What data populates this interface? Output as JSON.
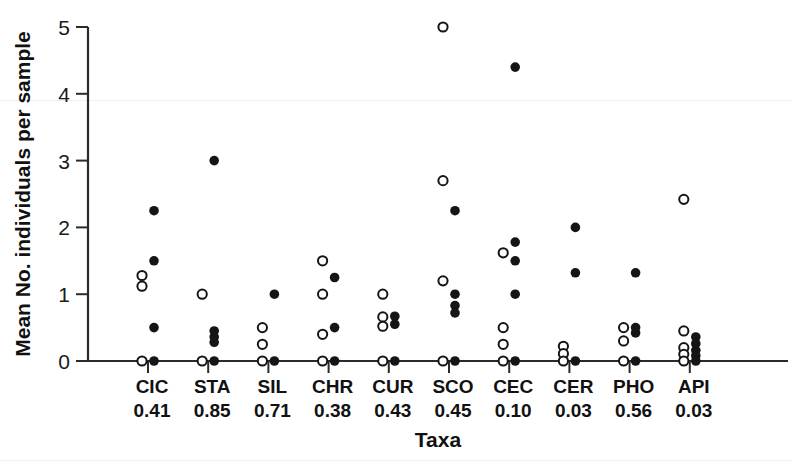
{
  "figure": {
    "y_axis_title": "Mean No. individuals per sample",
    "x_axis_title": "Taxa"
  },
  "chart_data": {
    "type": "scatter",
    "title": "",
    "xlabel": "Taxa",
    "ylabel": "Mean No. individuals per sample",
    "ylim": [
      0,
      5
    ],
    "yticks": [
      0,
      1,
      2,
      3,
      4,
      5
    ],
    "ytick_labels": [
      "0",
      "1",
      "2",
      "3",
      "4",
      "5"
    ],
    "grid": false,
    "legend": "none",
    "categories": [
      "CIC",
      "STA",
      "SIL",
      "CHR",
      "CUR",
      "SCO",
      "CEC",
      "CER",
      "PHO",
      "API"
    ],
    "category_values": [
      "0.41",
      "0.85",
      "0.71",
      "0.38",
      "0.43",
      "0.45",
      "0.10",
      "0.03",
      "0.56",
      "0.03"
    ],
    "series": [
      {
        "name": "open",
        "marker": "open-circle",
        "points": [
          {
            "category": "CIC",
            "values": [
              1.28,
              1.12,
              0.0
            ]
          },
          {
            "category": "STA",
            "values": [
              1.0,
              0.0
            ]
          },
          {
            "category": "SIL",
            "values": [
              0.5,
              0.25,
              0.0
            ]
          },
          {
            "category": "CHR",
            "values": [
              1.5,
              1.0,
              0.4,
              0.0
            ]
          },
          {
            "category": "CUR",
            "values": [
              1.0,
              0.66,
              0.52,
              0.0
            ]
          },
          {
            "category": "SCO",
            "values": [
              5.0,
              2.7,
              1.2,
              0.0
            ]
          },
          {
            "category": "CEC",
            "values": [
              1.62,
              0.5,
              0.25,
              0.0
            ]
          },
          {
            "category": "CER",
            "values": [
              0.22,
              0.11,
              0.0
            ]
          },
          {
            "category": "PHO",
            "values": [
              0.5,
              0.3,
              0.0
            ]
          },
          {
            "category": "API",
            "values": [
              2.42,
              0.45,
              0.2,
              0.1,
              0.0
            ]
          }
        ]
      },
      {
        "name": "filled",
        "marker": "filled-circle",
        "points": [
          {
            "category": "CIC",
            "values": [
              2.25,
              1.5,
              0.5,
              0.0
            ]
          },
          {
            "category": "STA",
            "values": [
              3.0,
              0.45,
              0.36,
              0.28,
              0.0
            ]
          },
          {
            "category": "SIL",
            "values": [
              1.0,
              0.0
            ]
          },
          {
            "category": "CHR",
            "values": [
              1.25,
              0.5,
              0.0
            ]
          },
          {
            "category": "CUR",
            "values": [
              0.67,
              0.55,
              0.0
            ]
          },
          {
            "category": "SCO",
            "values": [
              2.25,
              1.0,
              0.83,
              0.72,
              0.0
            ]
          },
          {
            "category": "CEC",
            "values": [
              4.4,
              1.78,
              1.5,
              1.0,
              0.0
            ]
          },
          {
            "category": "CER",
            "values": [
              2.0,
              1.32,
              0.0
            ]
          },
          {
            "category": "PHO",
            "values": [
              1.32,
              0.5,
              0.42,
              0.0
            ]
          },
          {
            "category": "API",
            "values": [
              0.36,
              0.26,
              0.16,
              0.08,
              0.0
            ]
          }
        ]
      }
    ]
  }
}
